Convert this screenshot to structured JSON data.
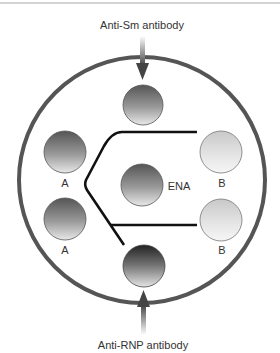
{
  "diagram": {
    "title_top": "Anti-Sm antibody",
    "title_bottom": "Anti-RNP antibody",
    "center_label": "ENA",
    "wells": [
      {
        "id": "top",
        "label": "",
        "tone": "medium-dark"
      },
      {
        "id": "left-upper",
        "label": "A",
        "tone": "medium-dark"
      },
      {
        "id": "left-lower",
        "label": "A",
        "tone": "medium-dark"
      },
      {
        "id": "center",
        "label": "ENA",
        "tone": "medium-dark"
      },
      {
        "id": "right-upper",
        "label": "B",
        "tone": "light"
      },
      {
        "id": "right-lower",
        "label": "B",
        "tone": "light"
      },
      {
        "id": "bottom",
        "label": "",
        "tone": "dark"
      }
    ],
    "arrows": [
      {
        "from": "Anti-Sm antibody",
        "to": "top-well",
        "direction": "down"
      },
      {
        "from": "Anti-RNP antibody",
        "to": "bottom-well",
        "direction": "up"
      }
    ],
    "precipitin_lines": "identity arc between A wells and ENA; lines extending toward B wells",
    "colors": {
      "outer_ring": "#555555",
      "precipitin_line": "#111111",
      "arrow": "#444444",
      "text": "#333333"
    }
  }
}
